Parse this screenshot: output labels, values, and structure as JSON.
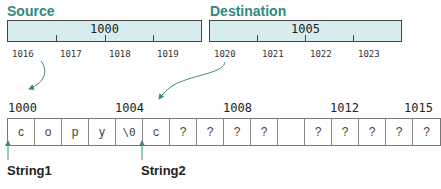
{
  "source": {
    "title": "Source",
    "value": "1000",
    "addresses": [
      "1016",
      "1017",
      "1018",
      "1019"
    ]
  },
  "destination": {
    "title": "Destination",
    "value": "1005",
    "addresses": [
      "1020",
      "1021",
      "1022",
      "1023"
    ]
  },
  "memory": {
    "address_labels": [
      {
        "text": "1000",
        "index": 0
      },
      {
        "text": "1004",
        "index": 4
      },
      {
        "text": "1008",
        "index": 8
      },
      {
        "text": "1012",
        "index": 12
      },
      {
        "text": "1015",
        "index": 15
      }
    ],
    "cells": [
      "c",
      "o",
      "p",
      "y",
      "\\0",
      "c",
      "?",
      "?",
      "?",
      "?",
      "",
      "?",
      "?",
      "?",
      "?",
      "?"
    ]
  },
  "pointers": {
    "string1": "String1",
    "string2": "String2"
  },
  "colors": {
    "accent": "#2e8a7c",
    "box_fill": "#d6ecee",
    "arrow": "#3a8a80"
  }
}
